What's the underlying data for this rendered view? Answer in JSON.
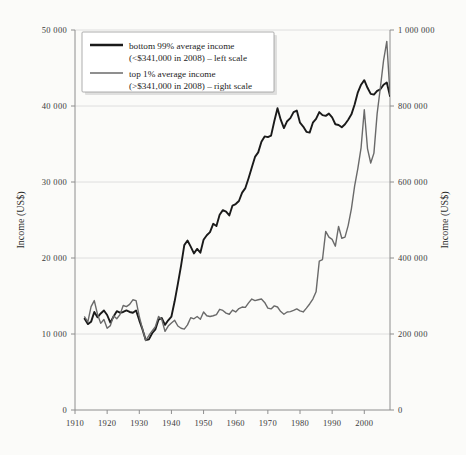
{
  "chart_data": {
    "type": "line",
    "title": "",
    "xlabel": "",
    "ylabel": "Income (US$)",
    "y2label": "Income (US$)",
    "xlim": [
      1910,
      2008
    ],
    "ylim": [
      0,
      50000
    ],
    "y2lim": [
      0,
      1000000
    ],
    "grid": true,
    "legend_position": "top-left",
    "x_ticks": [
      1910,
      1920,
      1930,
      1940,
      1950,
      1960,
      1970,
      1980,
      1990,
      2000
    ],
    "x_tick_labels": [
      "1910",
      "1920",
      "1930",
      "1940",
      "1950",
      "1960",
      "1970",
      "1980",
      "1990",
      "2000"
    ],
    "y_ticks": [
      0,
      10000,
      20000,
      30000,
      40000,
      50000
    ],
    "y_tick_labels": [
      "0",
      "10 000",
      "20 000",
      "30 000",
      "40 000",
      "50 000"
    ],
    "y2_ticks": [
      0,
      200000,
      400000,
      600000,
      800000,
      1000000
    ],
    "y2_tick_labels": [
      "0",
      "200 000",
      "400 000",
      "600 000",
      "800 000",
      "1 000 000"
    ],
    "series": [
      {
        "name": "bottom 99% average income",
        "legend_line1": "bottom 99% average income",
        "legend_line2": "(<$341,000 in 2008) – left scale",
        "axis": "left",
        "color": "#1a1a1a",
        "width": 1.9,
        "x": [
          1913,
          1914,
          1915,
          1916,
          1917,
          1918,
          1919,
          1920,
          1921,
          1922,
          1923,
          1924,
          1925,
          1926,
          1927,
          1928,
          1929,
          1930,
          1931,
          1932,
          1933,
          1934,
          1935,
          1936,
          1937,
          1938,
          1939,
          1940,
          1941,
          1942,
          1943,
          1944,
          1945,
          1946,
          1947,
          1948,
          1949,
          1950,
          1951,
          1952,
          1953,
          1954,
          1955,
          1956,
          1957,
          1958,
          1959,
          1960,
          1961,
          1962,
          1963,
          1964,
          1965,
          1966,
          1967,
          1968,
          1969,
          1970,
          1971,
          1972,
          1973,
          1974,
          1975,
          1976,
          1977,
          1978,
          1979,
          1980,
          1981,
          1982,
          1983,
          1984,
          1985,
          1986,
          1987,
          1988,
          1989,
          1990,
          1991,
          1992,
          1993,
          1994,
          1995,
          1996,
          1997,
          1998,
          1999,
          2000,
          2001,
          2002,
          2003,
          2004,
          2005,
          2006,
          2007,
          2008
        ],
        "values": [
          12000,
          11300,
          11600,
          12900,
          12200,
          12700,
          13100,
          12500,
          11500,
          12300,
          13000,
          12800,
          12900,
          13100,
          12900,
          12800,
          13100,
          11800,
          10600,
          9200,
          9300,
          10100,
          10600,
          11900,
          12100,
          11200,
          11800,
          12300,
          14300,
          16600,
          19000,
          21700,
          22300,
          21500,
          20600,
          21200,
          20700,
          22400,
          23000,
          23400,
          24500,
          24200,
          25700,
          26300,
          26100,
          25600,
          26900,
          27100,
          27500,
          28600,
          29200,
          30500,
          31900,
          33300,
          33900,
          35300,
          36000,
          35900,
          36100,
          38000,
          39700,
          38200,
          37100,
          38000,
          38400,
          39200,
          39400,
          37800,
          37300,
          36600,
          36500,
          37800,
          38300,
          39200,
          38800,
          38700,
          39000,
          38500,
          37600,
          37500,
          37200,
          37600,
          38200,
          38900,
          40200,
          41800,
          42800,
          43400,
          42400,
          41600,
          41500,
          42000,
          42200,
          42800,
          43100,
          41300
        ]
      },
      {
        "name": "top 1% average income",
        "legend_line1": "top 1% average income",
        "legend_line2": "(>$341,000 in 2008) – right scale",
        "axis": "right",
        "color": "#6a6a6a",
        "width": 1.4,
        "x": [
          1913,
          1914,
          1915,
          1916,
          1917,
          1918,
          1919,
          1920,
          1921,
          1922,
          1923,
          1924,
          1925,
          1926,
          1927,
          1928,
          1929,
          1930,
          1931,
          1932,
          1933,
          1934,
          1935,
          1936,
          1937,
          1938,
          1939,
          1940,
          1941,
          1942,
          1943,
          1944,
          1945,
          1946,
          1947,
          1948,
          1949,
          1950,
          1951,
          1952,
          1953,
          1954,
          1955,
          1956,
          1957,
          1958,
          1959,
          1960,
          1961,
          1962,
          1963,
          1964,
          1965,
          1966,
          1967,
          1968,
          1969,
          1970,
          1971,
          1972,
          1973,
          1974,
          1975,
          1976,
          1977,
          1978,
          1979,
          1980,
          1981,
          1982,
          1983,
          1984,
          1985,
          1986,
          1987,
          1988,
          1989,
          1990,
          1991,
          1992,
          1993,
          1994,
          1995,
          1996,
          1997,
          1998,
          1999,
          2000,
          2001,
          2002,
          2003,
          2004,
          2005,
          2006,
          2007,
          2008
        ],
        "values": [
          245000,
          232000,
          272000,
          288000,
          252000,
          228000,
          238000,
          215000,
          222000,
          248000,
          240000,
          251000,
          275000,
          272000,
          278000,
          290000,
          288000,
          246000,
          213000,
          183000,
          196000,
          208000,
          219000,
          246000,
          238000,
          207000,
          221000,
          229000,
          236000,
          221000,
          215000,
          213000,
          224000,
          243000,
          240000,
          246000,
          239000,
          258000,
          248000,
          246000,
          248000,
          251000,
          265000,
          262000,
          255000,
          252000,
          263000,
          258000,
          267000,
          271000,
          270000,
          282000,
          292000,
          288000,
          290000,
          292000,
          283000,
          268000,
          266000,
          274000,
          271000,
          259000,
          252000,
          258000,
          259000,
          262000,
          266000,
          261000,
          258000,
          268000,
          279000,
          292000,
          311000,
          392000,
          396000,
          470000,
          455000,
          449000,
          431000,
          483000,
          452000,
          455000,
          486000,
          530000,
          590000,
          636000,
          690000,
          790000,
          688000,
          650000,
          676000,
          780000,
          848000,
          920000,
          970000,
          830000
        ]
      }
    ]
  }
}
